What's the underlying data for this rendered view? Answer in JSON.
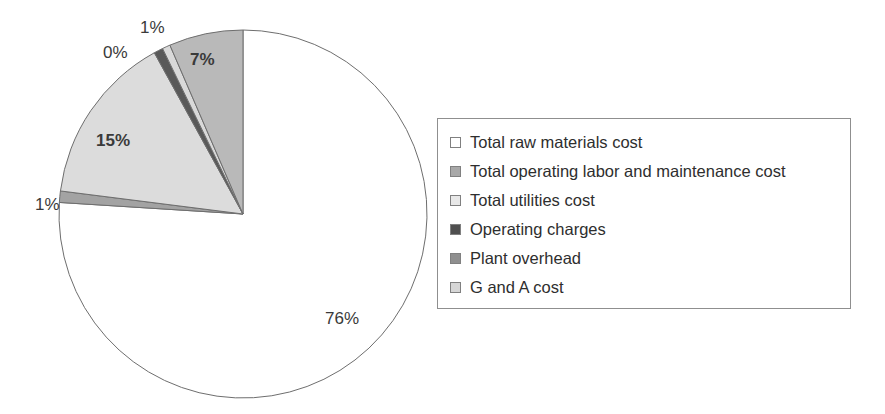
{
  "chart_data": {
    "type": "pie",
    "title": "",
    "subtitle": "",
    "xlabel": "",
    "ylabel": "",
    "grid": false,
    "legend_position": "right",
    "start_angle_deg": 0,
    "direction": "clockwise",
    "categories": [
      "Total raw materials cost",
      "Total operating labor and maintenance cost",
      "Total utilities cost",
      "Operating charges",
      "Plant overhead",
      "G and A cost"
    ],
    "values": [
      76,
      7,
      1,
      0,
      1,
      15
    ],
    "data_labels": [
      "76%",
      "7%",
      "1%",
      "0%",
      "1%",
      "15%"
    ],
    "colors": [
      "#ffffff",
      "#b9b9b9",
      "#d9d9d9",
      "#595959",
      "#a3a3a3",
      "#dcdcdc"
    ],
    "slice_order_clockwise_from_top": [
      "Total raw materials cost",
      "Plant overhead",
      "G and A cost",
      "Operating charges",
      "Total utilities cost",
      "Total operating labor and maintenance cost"
    ],
    "slice_border_color": "#6e6e6e",
    "annotations": []
  },
  "pie": {
    "center_x": 243,
    "center_y": 214,
    "radius": 184,
    "slices": [
      {
        "name": "total-raw-materials-cost",
        "label": "Total raw materials cost",
        "percent": 76,
        "display": "76%",
        "color": "#ffffff"
      },
      {
        "name": "plant-overhead",
        "label": "Plant overhead",
        "percent": 1,
        "display": "1%",
        "color": "#a3a3a3"
      },
      {
        "name": "g-and-a-cost",
        "label": "G and A cost",
        "percent": 15,
        "display": "15%",
        "color": "#dcdcdc"
      },
      {
        "name": "operating-charges",
        "label": "Operating charges",
        "percent": 0.8,
        "display": "0%",
        "color": "#595959"
      },
      {
        "name": "total-utilities-cost",
        "label": "Total utilities cost",
        "percent": 0.7,
        "display": "1%",
        "color": "#d9d9d9"
      },
      {
        "name": "total-operating-labor-and-maintenance-cost",
        "label": "Total operating labor and maintenance cost",
        "percent": 6.5,
        "display": "7%",
        "color": "#b9b9b9"
      }
    ],
    "labels": [
      {
        "name": "pie-label-76",
        "text": "76%",
        "x": 325,
        "y": 310,
        "bold": false
      },
      {
        "name": "pie-label-1-left",
        "text": "1%",
        "x": 35,
        "y": 196,
        "bold": false
      },
      {
        "name": "pie-label-15",
        "text": "15%",
        "x": 96,
        "y": 132,
        "bold": true
      },
      {
        "name": "pie-label-0",
        "text": "0%",
        "x": 103,
        "y": 44,
        "bold": false
      },
      {
        "name": "pie-label-1-top",
        "text": "1%",
        "x": 140,
        "y": 19,
        "bold": false
      },
      {
        "name": "pie-label-7",
        "text": "7%",
        "x": 190,
        "y": 51,
        "bold": true
      }
    ]
  },
  "legend": {
    "border_color": "#8f8f8f",
    "items": [
      {
        "label": "Total raw materials cost",
        "color": "#ffffff",
        "icon": "legend-swatch-icon"
      },
      {
        "label": "Total operating labor and maintenance cost",
        "color": "#a8a8a8",
        "icon": "legend-swatch-icon"
      },
      {
        "label": "Total utilities cost",
        "color": "#e8e8e8",
        "icon": "legend-swatch-icon"
      },
      {
        "label": "Operating charges",
        "color": "#4f4f4f",
        "icon": "legend-swatch-icon"
      },
      {
        "label": "Plant overhead",
        "color": "#8f8f8f",
        "icon": "legend-swatch-icon"
      },
      {
        "label": "G and A cost",
        "color": "#d6d6d6",
        "icon": "legend-swatch-icon"
      }
    ]
  }
}
